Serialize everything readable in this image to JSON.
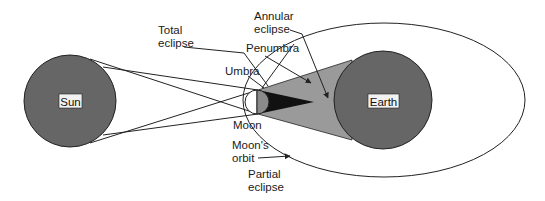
{
  "diagram": {
    "type": "solar-eclipse",
    "colors": {
      "body_fill": "#666666",
      "penumbra": "#9a9a9a",
      "umbra": "#111111",
      "moon_lit": "#ffffff",
      "moon_dark": "#8a8a8a",
      "label_box": "#f2f2f2",
      "line": "#222222"
    },
    "bodies": {
      "sun": {
        "label": "Sun"
      },
      "earth": {
        "label": "Earth"
      },
      "moon": {
        "label": "Moon"
      }
    },
    "labels": {
      "total_eclipse": [
        "Total",
        "eclipse"
      ],
      "annular_eclipse": [
        "Annular",
        "eclipse"
      ],
      "penumbra": "Penumbra",
      "umbra": "Umbra",
      "moon": "Moon",
      "moons_orbit": [
        "Moon's",
        "orbit"
      ],
      "partial_eclipse": [
        "Partial",
        "eclipse"
      ]
    }
  }
}
